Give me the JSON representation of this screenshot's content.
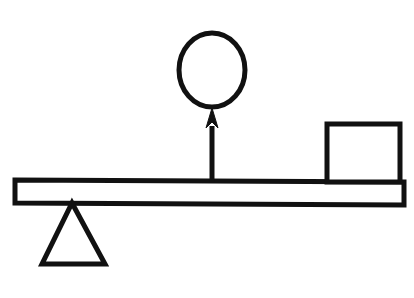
{
  "figure": {
    "background_color": "#ffffff",
    "stroke_color": "#111111",
    "fill_color": "#ffffff",
    "width": 414,
    "height": 298
  },
  "elements": {
    "lever_bar": {
      "name": "lever-bar",
      "shape": "rectangle",
      "description": "Horizontal rigid beam, slightly tilted down to the right",
      "stroke_width": 5,
      "points": "15,180 404,182 404,205 15,203",
      "left_x": 15,
      "right_x": 404,
      "top_left_y": 180,
      "top_right_y": 182,
      "thickness": 23
    },
    "fulcrum": {
      "name": "fulcrum-triangle",
      "shape": "triangle",
      "description": "Triangular pivot support under the bar near the left end",
      "stroke_width": 5,
      "points": "72,203 105,264 42,264",
      "apex_x": 72,
      "apex_y": 203,
      "base_left_x": 42,
      "base_right_x": 105,
      "base_y": 264
    },
    "load_block": {
      "name": "load-block-square",
      "shape": "rectangle",
      "description": "Square weight resting on the right end of the bar",
      "stroke_width": 5,
      "left_x": 327,
      "top_y": 124,
      "width": 73,
      "height": 58
    },
    "force_arrow": {
      "name": "upward-force-arrow",
      "shape": "arrow",
      "description": "Arrow pointing upward from the bar toward the circle",
      "shaft_x": 212,
      "shaft_top_y": 124,
      "shaft_bottom_y": 182,
      "shaft_width": 5,
      "head_tip_y": 108,
      "head_half_width": 6,
      "head_bottom_y": 128,
      "direction": "up"
    },
    "circle": {
      "name": "circle-outline",
      "shape": "circle",
      "description": "Open circle above the arrow tip",
      "stroke_width": 5,
      "center_x": 212,
      "center_y": 70,
      "radius_x": 34,
      "radius_y": 38
    }
  }
}
